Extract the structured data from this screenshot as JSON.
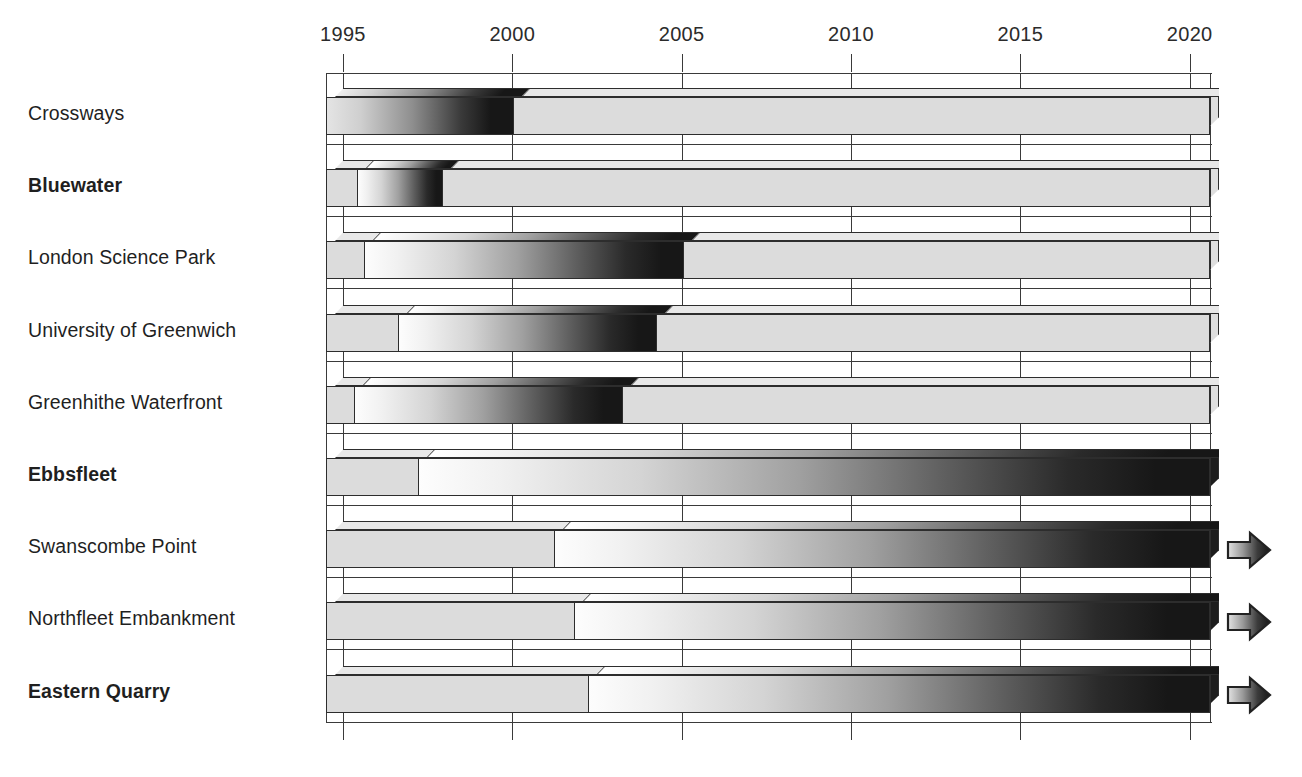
{
  "chart_data": {
    "type": "bar",
    "title": "",
    "subtitle": "",
    "xlabel": "",
    "ylabel": "",
    "orientation": "horizontal",
    "style": "3d-gantt-phase-bar",
    "xlim": [
      1995,
      2020
    ],
    "axis_ticks": [
      1995,
      2000,
      2005,
      2010,
      2015,
      2020
    ],
    "tick_labels": [
      "1995",
      "2000",
      "2005",
      "2010",
      "2015",
      "2020"
    ],
    "grid": "vertical-gridlines-at-ticks",
    "legend": "none",
    "legend_position": "none",
    "plot_left_year": 1994.5,
    "plot_right_year": 2020.6,
    "phase_shading": {
      "light": "#dcdcdc",
      "white": "#fdfdfd",
      "dark": "#171717",
      "description": "each bar runs from a pale 'planning' block through a light-to-dark gradient 'construction/build-out' phase to solid dark, then back to pale where complete"
    },
    "categories": [
      "Crossways",
      "Bluewater",
      "London Science Park",
      "University of Greenwich",
      "Greenhithe Waterfront",
      "Ebbsfleet",
      "Swanscombe Point",
      "Northfleet Embankment",
      "Eastern Quarry"
    ],
    "bold_categories": [
      "Bluewater",
      "Ebbsfleet",
      "Eastern Quarry"
    ],
    "rows": [
      {
        "label": "Crossways",
        "bold": false,
        "start_year": 1994.5,
        "end_year": 2020.6,
        "continues": false,
        "segments": [
          {
            "name": "ramp-to-dark",
            "from_year": 1994.5,
            "to_year": 2000.0,
            "fill": "gradient-light-to-dark"
          },
          {
            "name": "complete",
            "from_year": 2000.0,
            "to_year": 2020.6,
            "fill": "light"
          }
        ]
      },
      {
        "label": "Bluewater",
        "bold": true,
        "start_year": 1994.5,
        "end_year": 2020.6,
        "continues": false,
        "segments": [
          {
            "name": "planning",
            "from_year": 1994.5,
            "to_year": 1995.4,
            "fill": "light"
          },
          {
            "name": "ramp-to-dark",
            "from_year": 1995.4,
            "to_year": 1997.9,
            "fill": "gradient-white-to-dark"
          },
          {
            "name": "complete",
            "from_year": 1997.9,
            "to_year": 2020.6,
            "fill": "light"
          }
        ]
      },
      {
        "label": "London Science Park",
        "bold": false,
        "start_year": 1994.5,
        "end_year": 2020.6,
        "continues": false,
        "segments": [
          {
            "name": "planning",
            "from_year": 1994.5,
            "to_year": 1995.6,
            "fill": "light"
          },
          {
            "name": "ramp-to-dark",
            "from_year": 1995.6,
            "to_year": 2005.0,
            "fill": "gradient-white-to-dark"
          },
          {
            "name": "complete",
            "from_year": 2005.0,
            "to_year": 2020.6,
            "fill": "light"
          }
        ]
      },
      {
        "label": "University of Greenwich",
        "bold": false,
        "start_year": 1994.5,
        "end_year": 2020.6,
        "continues": false,
        "segments": [
          {
            "name": "planning",
            "from_year": 1994.5,
            "to_year": 1996.6,
            "fill": "light"
          },
          {
            "name": "ramp-to-dark",
            "from_year": 1996.6,
            "to_year": 2004.2,
            "fill": "gradient-white-to-dark"
          },
          {
            "name": "complete",
            "from_year": 2004.2,
            "to_year": 2020.6,
            "fill": "light"
          }
        ]
      },
      {
        "label": "Greenhithe Waterfront",
        "bold": false,
        "start_year": 1994.5,
        "end_year": 2020.6,
        "continues": false,
        "segments": [
          {
            "name": "planning",
            "from_year": 1994.5,
            "to_year": 1995.3,
            "fill": "light"
          },
          {
            "name": "ramp-to-dark",
            "from_year": 1995.3,
            "to_year": 2003.2,
            "fill": "gradient-white-to-dark"
          },
          {
            "name": "complete",
            "from_year": 2003.2,
            "to_year": 2020.6,
            "fill": "light"
          }
        ]
      },
      {
        "label": "Ebbsfleet",
        "bold": true,
        "start_year": 1994.5,
        "end_year": 2020.6,
        "continues": false,
        "segments": [
          {
            "name": "planning",
            "from_year": 1994.5,
            "to_year": 1997.2,
            "fill": "light"
          },
          {
            "name": "ramp-to-dark",
            "from_year": 1997.2,
            "to_year": 2020.6,
            "fill": "gradient-white-to-dark"
          }
        ]
      },
      {
        "label": "Swanscombe Point",
        "bold": false,
        "start_year": 1994.5,
        "end_year": 2020.6,
        "continues": true,
        "segments": [
          {
            "name": "planning",
            "from_year": 1994.5,
            "to_year": 2001.2,
            "fill": "light"
          },
          {
            "name": "ramp-to-dark",
            "from_year": 2001.2,
            "to_year": 2020.6,
            "fill": "gradient-white-to-dark"
          }
        ]
      },
      {
        "label": "Northfleet Embankment",
        "bold": false,
        "start_year": 1994.5,
        "end_year": 2020.6,
        "continues": true,
        "segments": [
          {
            "name": "planning",
            "from_year": 1994.5,
            "to_year": 2001.8,
            "fill": "light"
          },
          {
            "name": "ramp-to-dark",
            "from_year": 2001.8,
            "to_year": 2020.6,
            "fill": "gradient-white-to-dark"
          }
        ]
      },
      {
        "label": "Eastern Quarry",
        "bold": true,
        "start_year": 1994.5,
        "end_year": 2020.6,
        "continues": true,
        "segments": [
          {
            "name": "planning",
            "from_year": 1994.5,
            "to_year": 2002.2,
            "fill": "light"
          },
          {
            "name": "ramp-to-dark",
            "from_year": 2002.2,
            "to_year": 2020.6,
            "fill": "gradient-white-to-dark"
          }
        ]
      }
    ],
    "annotations": [
      {
        "type": "continuation-arrow",
        "row": "Swanscombe Point",
        "meaning": "timeline continues beyond 2020"
      },
      {
        "type": "continuation-arrow",
        "row": "Northfleet Embankment",
        "meaning": "timeline continues beyond 2020"
      },
      {
        "type": "continuation-arrow",
        "row": "Eastern Quarry",
        "meaning": "timeline continues beyond 2020"
      }
    ]
  },
  "colors": {
    "ink": "#2d2d2d",
    "light_fill": "#dcdcdc",
    "white_fill": "#fdfdfd",
    "dark_fill": "#171717",
    "background": "#ffffff"
  }
}
